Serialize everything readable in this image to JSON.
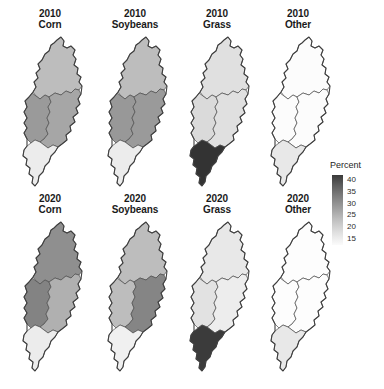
{
  "figure": {
    "background_color": "#ffffff",
    "width": 384,
    "height": 389,
    "outline_color": "#4d4d4d"
  },
  "legend": {
    "title": "Percent",
    "ticks": [
      "40",
      "35",
      "30",
      "25",
      "20",
      "15"
    ],
    "min": 15,
    "max": 40,
    "orientation": "vertical",
    "high_color": "#3a3a3a",
    "low_color": "#fbfbfb"
  },
  "panels": [
    {
      "id": "p2010-corn",
      "year": "2010",
      "category": "Corn"
    },
    {
      "id": "p2010-soybeans",
      "year": "2010",
      "category": "Soybeans"
    },
    {
      "id": "p2010-grass",
      "year": "2010",
      "category": "Grass"
    },
    {
      "id": "p2010-other",
      "year": "2010",
      "category": "Other"
    },
    {
      "id": "p2020-corn",
      "year": "2020",
      "category": "Corn"
    },
    {
      "id": "p2020-soybeans",
      "year": "2020",
      "category": "Soybeans"
    },
    {
      "id": "p2020-grass",
      "year": "2020",
      "category": "Grass"
    },
    {
      "id": "p2020-other",
      "year": "2020",
      "category": "Other"
    }
  ],
  "chart_data": {
    "type": "map",
    "title": "",
    "subtitle": "",
    "xlabel": "",
    "ylabel": "",
    "legend_label": "Percent",
    "legend_position": "right",
    "value_range": [
      15,
      40
    ],
    "colormap": "greys_reversed",
    "grid": false,
    "subbasins": [
      "North",
      "West Central",
      "East Central",
      "South"
    ],
    "rows": [
      "2010",
      "2020"
    ],
    "columns": [
      "Corn",
      "Soybeans",
      "Grass",
      "Other"
    ],
    "panels": [
      {
        "year": "2010",
        "category": "Corn",
        "values": {
          "North": 27,
          "West Central": 33,
          "East Central": 31,
          "South": 17
        },
        "fills": {
          "North": "#bdbdbd",
          "West Central": "#9a9a9a",
          "East Central": "#a6a6a6",
          "South": "#ececec"
        }
      },
      {
        "year": "2010",
        "category": "Soybeans",
        "values": {
          "North": 27,
          "West Central": 34,
          "East Central": 33,
          "South": 17
        },
        "fills": {
          "North": "#bdbdbd",
          "West Central": "#989898",
          "East Central": "#9a9a9a",
          "South": "#ececec"
        }
      },
      {
        "year": "2010",
        "category": "Grass",
        "values": {
          "North": 19,
          "West Central": 20,
          "East Central": 19,
          "South": 42
        },
        "fills": {
          "North": "#e0e0e0",
          "West Central": "#dadada",
          "East Central": "#e0e0e0",
          "South": "#333333"
        }
      },
      {
        "year": "2010",
        "category": "Other",
        "values": {
          "North": 15,
          "West Central": 15,
          "East Central": 15,
          "South": 18
        },
        "fills": {
          "North": "#fcfcfc",
          "West Central": "#fcfcfc",
          "East Central": "#fcfcfc",
          "South": "#e8e8e8"
        }
      },
      {
        "year": "2020",
        "category": "Corn",
        "values": {
          "North": 33,
          "West Central": 35,
          "East Central": 29,
          "South": 17
        },
        "fills": {
          "North": "#8f8f8f",
          "West Central": "#838383",
          "East Central": "#b0b0b0",
          "South": "#ececec"
        }
      },
      {
        "year": "2020",
        "category": "Soybeans",
        "values": {
          "North": 27,
          "West Central": 27,
          "East Central": 35,
          "South": 16
        },
        "fills": {
          "North": "#bdbdbd",
          "West Central": "#bdbdbd",
          "East Central": "#858585",
          "South": "#f0f0f0"
        }
      },
      {
        "year": "2020",
        "category": "Grass",
        "values": {
          "North": 18,
          "West Central": 19,
          "East Central": 17,
          "South": 41
        },
        "fills": {
          "North": "#e8e8e8",
          "West Central": "#e2e2e2",
          "East Central": "#ededed",
          "South": "#3b3b3b"
        }
      },
      {
        "year": "2020",
        "category": "Other",
        "values": {
          "North": 15,
          "West Central": 15,
          "East Central": 15,
          "South": 18
        },
        "fills": {
          "North": "#fdfdfd",
          "West Central": "#fdfdfd",
          "East Central": "#fdfdfd",
          "South": "#e8e8e8"
        }
      }
    ]
  }
}
